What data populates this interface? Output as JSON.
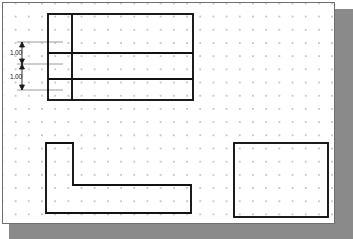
{
  "canvas": {
    "background_color": "#ffffff",
    "border_color": "#6e6e6e",
    "shadow_color": "#8a8a8a",
    "grid": {
      "style": "dot",
      "dot_color": "#c9c9c9",
      "spacing_px": 13.2
    }
  },
  "drawing": {
    "line_color": "#111111",
    "dimension_color": "#1a1a1a",
    "extension_line_color": "#9a9a9a",
    "shapes": [
      {
        "name": "top-divided-rectangle",
        "type": "rectangle-with-dividers",
        "x": 45,
        "y": 11,
        "width": 145,
        "height": 86,
        "vertical_dividers": [
          24
        ],
        "horizontal_dividers": [
          50,
          76
        ]
      },
      {
        "name": "l-shape-polygon",
        "type": "polygon",
        "points": "43,140 70,140 70,182 188,182 188,210 43,210"
      },
      {
        "name": "bottom-right-rectangle",
        "type": "rectangle",
        "x": 231,
        "y": 140,
        "width": 94,
        "height": 74
      }
    ],
    "dimensions": [
      {
        "name": "upper-dimension",
        "label": "1.00",
        "orientation": "vertical",
        "x": 19,
        "y_start": 39,
        "y_end": 61
      },
      {
        "name": "lower-dimension",
        "label": "1.00",
        "orientation": "vertical",
        "x": 19,
        "y_start": 61,
        "y_end": 87
      }
    ]
  }
}
